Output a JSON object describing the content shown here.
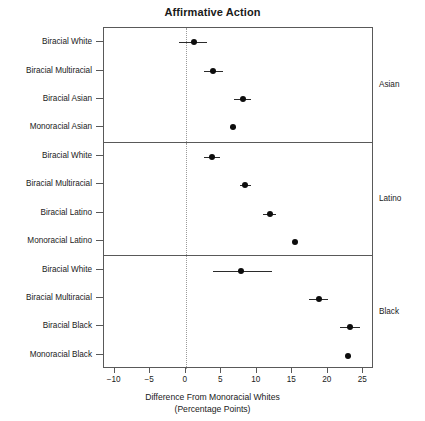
{
  "chart_data": {
    "type": "scatter",
    "title": "Affirmative Action",
    "xlabel_line1": "Difference From Monoracial Whites",
    "xlabel_line2": "(Percentage Points)",
    "ylabel": "",
    "xlim": [
      -11.5,
      26.5
    ],
    "xticks": [
      -10,
      -5,
      0,
      5,
      10,
      15,
      20,
      25
    ],
    "xticklabels": [
      "−10",
      "−5",
      "0",
      "5",
      "10",
      "15",
      "20",
      "25"
    ],
    "grid": false,
    "reference_line": 0,
    "legend": "none",
    "panel_label_position": "right",
    "panels": [
      {
        "name": "Asian",
        "categories": [
          "Biracial White",
          "Biracial Multiracial",
          "Biracial Asian",
          "Monoracial Asian"
        ],
        "values": [
          1.1,
          3.9,
          8.0,
          6.7
        ],
        "ci_low": [
          -0.9,
          2.6,
          6.8,
          6.3
        ],
        "ci_high": [
          3.0,
          5.2,
          9.2,
          7.1
        ]
      },
      {
        "name": "Latino",
        "categories": [
          "Biracial White",
          "Biracial Multiracial",
          "Biracial Latino",
          "Monoracial Latino"
        ],
        "values": [
          3.7,
          8.4,
          11.8,
          15.4
        ],
        "ci_low": [
          2.6,
          7.6,
          10.9,
          15.1
        ],
        "ci_high": [
          4.8,
          9.2,
          12.7,
          15.7
        ]
      },
      {
        "name": "Black",
        "categories": [
          "Biracial White",
          "Biracial Multiracial",
          "Biracial Black",
          "Monoracial Black"
        ],
        "values": [
          7.8,
          18.7,
          23.1,
          22.9
        ],
        "ci_low": [
          3.9,
          17.4,
          21.7,
          22.6
        ],
        "ci_high": [
          12.2,
          20.0,
          24.6,
          23.2
        ]
      }
    ]
  },
  "colors": {
    "point": "#0d0d0d",
    "interval": "#2b2b2b",
    "frame": "#595959",
    "reference": "#9a9a9a",
    "background": "#ffffff"
  }
}
